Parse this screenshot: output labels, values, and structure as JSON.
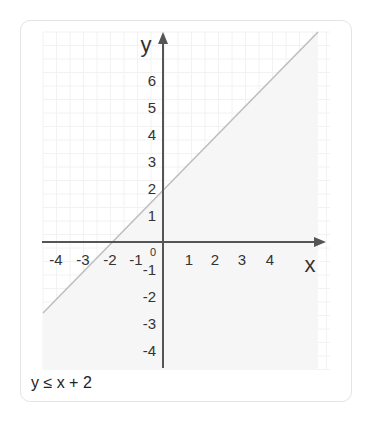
{
  "chart_data": {
    "type": "line",
    "title": "",
    "xlabel": "x",
    "ylabel": "y",
    "xlim": [
      -4.5,
      6
    ],
    "ylim": [
      -4.5,
      7.5
    ],
    "x_ticks": [
      "-4",
      "-3",
      "-2",
      "-1",
      "1",
      "2",
      "3",
      "4"
    ],
    "y_ticks": [
      "6",
      "5",
      "4",
      "3",
      "2",
      "1",
      "-1",
      "-2",
      "-3",
      "-4"
    ],
    "origin_label": "0",
    "grid": true,
    "series": [
      {
        "name": "y = x + 2 (boundary)",
        "x": [
          -4.4,
          5.7
        ],
        "y": [
          -2.4,
          7.7
        ],
        "style": "solid"
      }
    ],
    "shaded_region": "below line",
    "annotation": "y ≤ x + 2"
  },
  "caption": "y ≤ x + 2",
  "colors": {
    "axis": "#555555",
    "line": "#bdbdbd",
    "grid": "#f1f1f1",
    "text": "#333333"
  }
}
